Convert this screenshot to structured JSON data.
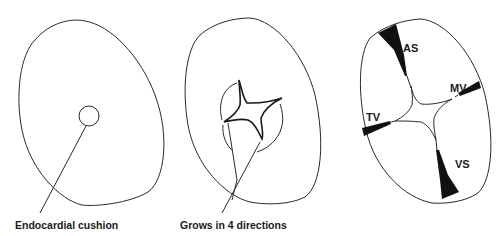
{
  "figure": {
    "panels": [
      {
        "id": "panel-1",
        "caption": "Endocardial cushion"
      },
      {
        "id": "panel-2",
        "caption": "Grows in 4 directions"
      },
      {
        "id": "panel-3",
        "labels": {
          "as": "AS",
          "mv": "MV",
          "tv": "TV",
          "vs": "VS"
        }
      }
    ],
    "colors": {
      "line": "#2a2a2a",
      "fill": "#111111",
      "background": "#ffffff"
    }
  }
}
